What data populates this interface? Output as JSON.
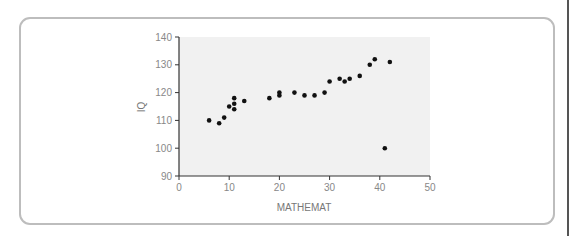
{
  "chart_data": {
    "type": "scatter",
    "title": "",
    "xlabel": "MATHEMAT",
    "ylabel": "IQ",
    "xlim": [
      0,
      50
    ],
    "ylim": [
      90,
      140
    ],
    "x_ticks": [
      0,
      10,
      20,
      30,
      40,
      50
    ],
    "y_ticks": [
      90,
      100,
      110,
      120,
      130,
      140
    ],
    "grid": false,
    "legend": null,
    "series": [
      {
        "name": "IQ vs MATHEMAT",
        "color": "#111111",
        "points": [
          {
            "x": 6,
            "y": 110
          },
          {
            "x": 8,
            "y": 109
          },
          {
            "x": 9,
            "y": 111
          },
          {
            "x": 10,
            "y": 115
          },
          {
            "x": 11,
            "y": 118
          },
          {
            "x": 11,
            "y": 116
          },
          {
            "x": 11,
            "y": 114
          },
          {
            "x": 13,
            "y": 117
          },
          {
            "x": 18,
            "y": 118
          },
          {
            "x": 20,
            "y": 120
          },
          {
            "x": 20,
            "y": 119
          },
          {
            "x": 23,
            "y": 120
          },
          {
            "x": 25,
            "y": 119
          },
          {
            "x": 27,
            "y": 119
          },
          {
            "x": 29,
            "y": 120
          },
          {
            "x": 30,
            "y": 124
          },
          {
            "x": 32,
            "y": 125
          },
          {
            "x": 33,
            "y": 124
          },
          {
            "x": 34,
            "y": 125
          },
          {
            "x": 36,
            "y": 126
          },
          {
            "x": 38,
            "y": 130
          },
          {
            "x": 39,
            "y": 132
          },
          {
            "x": 41,
            "y": 100
          },
          {
            "x": 42,
            "y": 131
          }
        ]
      }
    ]
  },
  "colors": {
    "plot_background": "#f1f1f1",
    "axis": "#333333",
    "card_border": "#bdbdbd",
    "marker": "#111111"
  }
}
